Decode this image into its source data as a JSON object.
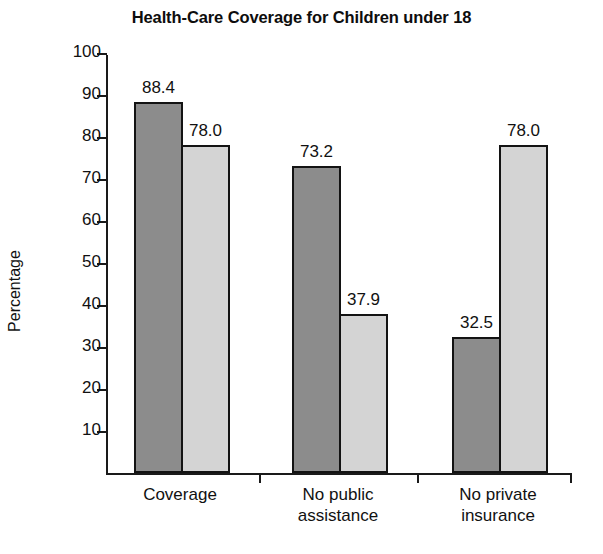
{
  "chart_data": {
    "type": "bar",
    "title": "Health-Care Coverage for Children under 18",
    "xlabel": "",
    "ylabel": "Percentage",
    "ylim": [
      0,
      100
    ],
    "yticks": [
      10,
      20,
      30,
      40,
      50,
      60,
      70,
      80,
      90,
      100
    ],
    "ytick_labels": [
      "10",
      "20",
      "30",
      "40",
      "50",
      "60",
      "70",
      "80",
      "90",
      "100"
    ],
    "grid": false,
    "legend": "none",
    "categories": [
      "Coverage",
      "No public\nassistance",
      "No private\ninsurance"
    ],
    "series": [
      {
        "name": "series-dark",
        "color": "#8c8c8c",
        "values": [
          88.4,
          73.2,
          32.5
        ],
        "value_labels": [
          "88.4",
          "73.2",
          "32.5"
        ]
      },
      {
        "name": "series-light",
        "color": "#d4d4d4",
        "values": [
          78.0,
          37.9,
          78.0
        ],
        "value_labels": [
          "78.0",
          "37.9",
          "78.0"
        ]
      }
    ]
  },
  "colors": {
    "dark_bar": "#8c8c8c",
    "light_bar": "#d4d4d4",
    "axis": "#1a1a1a",
    "text": "#111111",
    "background": "#ffffff"
  }
}
